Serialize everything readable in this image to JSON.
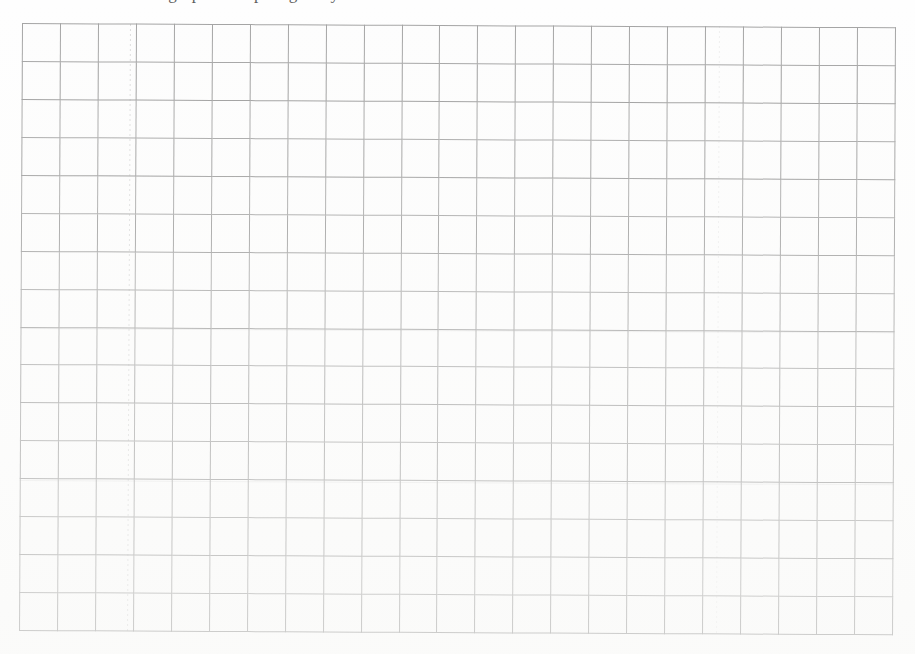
{
  "page": {
    "width": 915,
    "height": 654,
    "background_color": "#fefefe",
    "document_type": "scanned-worksheet-grid"
  },
  "header": {
    "clipped_text": "sograph        examples        granny",
    "note": "Top line of body text is cropped by the page edge; only glyph descenders are visible.",
    "visible": true
  },
  "grid": {
    "columns": 23,
    "rows": 16,
    "cell_width_px": 38,
    "cell_height_px": 38,
    "line_color": "#9a9a9a",
    "cell_fill_color": "#fdfdfd",
    "left_px": 22,
    "top_px": 23,
    "width_px": 874,
    "height_px": 608,
    "skew_degrees": 0.28,
    "cells_empty": true
  },
  "artifacts": {
    "vertical_streaks_x": [
      108,
      697
    ],
    "horizontal_bands_y": [
      152,
      305,
      457
    ]
  }
}
